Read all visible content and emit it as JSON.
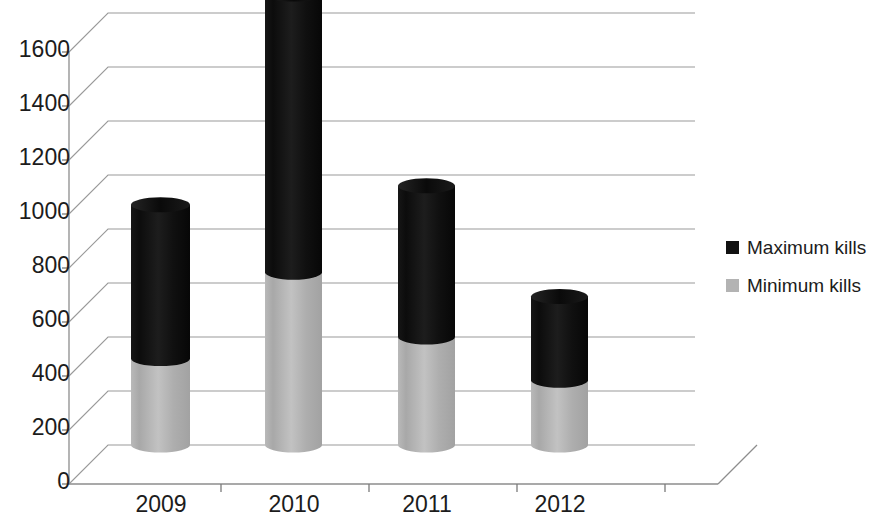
{
  "chart": {
    "type": "bar",
    "title": "",
    "xlabel": "",
    "ylabel": ""
  },
  "chart_data": {
    "type": "bar",
    "subtype": "stacked-3d-cylinder",
    "title": "",
    "subtitle": "",
    "xlabel": "",
    "ylabel": "",
    "categories": [
      "2009",
      "2010",
      "2011",
      "2012"
    ],
    "series": [
      {
        "name": "Minimum kills",
        "values": [
          320,
          640,
          400,
          240
        ],
        "color": "#b3b3b3"
      },
      {
        "name": "Maximum kills",
        "values": [
          890,
          1670,
          960,
          550
        ],
        "color": "#111111"
      }
    ],
    "stacking": "overlaid-total",
    "note_on_values": "Maximum kills values are the total bar top; Minimum kills is the grey lower portion.",
    "ylim": [
      0,
      1700
    ],
    "ytick_values": [
      0,
      200,
      400,
      600,
      800,
      1000,
      1200,
      1400,
      1600
    ],
    "ytick_labels": [
      "0",
      "200",
      "400",
      "600",
      "800",
      "1000",
      "1200",
      "1400",
      "1600"
    ],
    "xtick_labels": [
      "2009",
      "2010",
      "2011",
      "2012"
    ],
    "grid": true,
    "grid_axis": "y",
    "legend": [
      "Maximum kills",
      "Minimum kills"
    ],
    "legend_position": "right"
  },
  "legend": {
    "items": [
      {
        "label": "Maximum kills",
        "color": "#111111"
      },
      {
        "label": "Minimum kills",
        "color": "#b3b3b3"
      }
    ]
  },
  "axes": {
    "y_ticks": [
      "1600",
      "1400",
      "1200",
      "1000",
      "800",
      "600",
      "400",
      "200",
      "0"
    ],
    "x_ticks": [
      "2009",
      "2010",
      "2011",
      "2012"
    ]
  },
  "colors": {
    "maximum": "#111111",
    "minimum": "#b3b3b3",
    "grid": "#9a9a9a",
    "text": "#1c1c1c",
    "background": "#ffffff"
  }
}
